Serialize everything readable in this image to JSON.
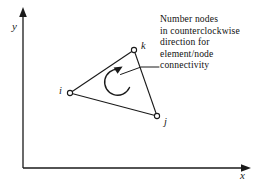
{
  "figure": {
    "background_color": "#ffffff",
    "stroke_color": "#1a1a1a",
    "axes": {
      "x_label": "x",
      "y_label": "y",
      "origin": [
        23,
        168
      ],
      "x_tip": [
        250,
        168
      ],
      "y_tip": [
        23,
        9
      ]
    },
    "element": {
      "type": "triangle",
      "nodes": [
        {
          "id": "i",
          "label": "i",
          "x": 70,
          "y": 93
        },
        {
          "id": "j",
          "label": "j",
          "x": 157,
          "y": 116
        },
        {
          "id": "k",
          "label": "k",
          "x": 134,
          "y": 50
        }
      ],
      "edges": [
        [
          "i",
          "k"
        ],
        [
          "k",
          "j"
        ],
        [
          "j",
          "i"
        ]
      ]
    },
    "rotation_arrow": {
      "name": "counterclockwise-arc-arrow",
      "center": [
        117,
        82
      ],
      "radius": 13,
      "direction": "counterclockwise",
      "arrowhead_at": [
        118,
        69
      ]
    },
    "leader_line": {
      "from": [
        158,
        67
      ],
      "bend": [
        141,
        67
      ],
      "to": [
        120,
        75
      ]
    },
    "annotation": {
      "lines": [
        "Number nodes",
        "in counterclockwise",
        "direction for",
        "element/node",
        "connectivity"
      ]
    }
  }
}
